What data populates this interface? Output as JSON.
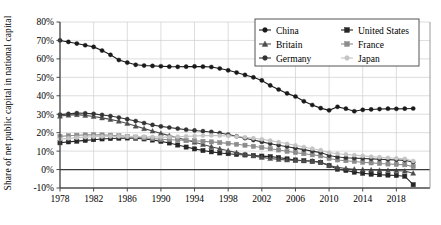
{
  "chart_data": {
    "type": "line",
    "title": "",
    "xlabel": "",
    "ylabel": "Share of net public capital in national capital",
    "xlim": [
      1978,
      2020
    ],
    "ylim": [
      -10,
      80
    ],
    "ytick_labels": [
      "80%",
      "70%",
      "60%",
      "50%",
      "40%",
      "30%",
      "20%",
      "10%",
      "0%",
      "-10%"
    ],
    "ytick_values": [
      80,
      70,
      60,
      50,
      40,
      30,
      20,
      10,
      0,
      -10
    ],
    "xtick_labels": [
      "1978",
      "1982",
      "1986",
      "1990",
      "1994",
      "1998",
      "2002",
      "2006",
      "2010",
      "2014",
      "2018"
    ],
    "xtick_values": [
      1978,
      1982,
      1986,
      1990,
      1994,
      1998,
      2002,
      2006,
      2010,
      2014,
      2018
    ],
    "grid": true,
    "legend_position": "top-right",
    "x": [
      1978,
      1979,
      1980,
      1981,
      1982,
      1983,
      1984,
      1985,
      1986,
      1987,
      1988,
      1989,
      1990,
      1991,
      1992,
      1993,
      1994,
      1995,
      1996,
      1997,
      1998,
      1999,
      2000,
      2001,
      2002,
      2003,
      2004,
      2005,
      2006,
      2007,
      2008,
      2009,
      2010,
      2011,
      2012,
      2013,
      2014,
      2015,
      2016,
      2017,
      2018,
      2019,
      2020
    ],
    "series": [
      {
        "name": "China",
        "color": "#1a1a1a",
        "marker": "circle",
        "values": [
          70,
          69.2,
          68.3,
          67.4,
          66.5,
          64.5,
          62.2,
          59.4,
          58.0,
          56.8,
          56.4,
          56.2,
          56.0,
          55.8,
          55.7,
          55.8,
          55.9,
          55.8,
          55.6,
          54.8,
          53.8,
          52.6,
          51.3,
          50.0,
          48.3,
          45.6,
          43.4,
          41.3,
          39.6,
          37.0,
          35.0,
          33.3,
          32.1,
          34.0,
          33.0,
          31.6,
          32.4,
          32.6,
          32.8,
          33.0,
          32.9,
          33.0,
          33.1
        ]
      },
      {
        "name": "United States",
        "color": "#262626",
        "marker": "square",
        "values": [
          14.5,
          15.0,
          15.4,
          15.8,
          16.2,
          16.6,
          16.8,
          17.0,
          17.1,
          17.0,
          16.6,
          16.0,
          15.3,
          14.4,
          13.3,
          12.2,
          11.2,
          10.3,
          9.6,
          9.0,
          8.6,
          8.2,
          7.9,
          7.6,
          7.3,
          7.0,
          6.5,
          5.8,
          5.2,
          4.8,
          4.5,
          3.9,
          2.2,
          0.2,
          -0.5,
          -1.4,
          -2.0,
          -2.5,
          -2.8,
          -3.0,
          -3.2,
          -3.6,
          -8.2
        ]
      },
      {
        "name": "Britain",
        "color": "#4d4d4d",
        "marker": "triangle",
        "values": [
          29.0,
          29.5,
          29.8,
          29.4,
          28.8,
          28.0,
          27.2,
          26.2,
          25.0,
          23.6,
          22.2,
          20.9,
          19.6,
          18.4,
          17.2,
          16.0,
          14.8,
          13.6,
          12.4,
          11.3,
          10.2,
          9.2,
          8.2,
          7.4,
          6.6,
          6.0,
          5.5,
          5.2,
          5.0,
          4.8,
          4.6,
          4.0,
          2.2,
          1.2,
          0.6,
          0.2,
          0.0,
          -0.2,
          -0.4,
          -0.5,
          -0.6,
          -0.8,
          -2.0
        ]
      },
      {
        "name": "France",
        "color": "#8c8c8c",
        "marker": "square",
        "values": [
          18.0,
          18.3,
          18.6,
          18.8,
          18.9,
          18.8,
          18.6,
          18.3,
          18.0,
          17.6,
          17.2,
          16.8,
          16.4,
          16.2,
          16.0,
          15.8,
          15.6,
          15.3,
          15.0,
          14.6,
          14.2,
          13.7,
          13.2,
          12.6,
          12.0,
          11.3,
          10.6,
          9.9,
          9.2,
          8.6,
          8.0,
          7.4,
          6.0,
          5.2,
          4.8,
          4.4,
          4.0,
          3.6,
          3.3,
          3.0,
          2.8,
          2.6,
          1.6
        ]
      },
      {
        "name": "Germany",
        "color": "#333333",
        "marker": "circle",
        "values": [
          29.8,
          30.2,
          30.6,
          30.5,
          30.2,
          29.6,
          29.0,
          28.2,
          27.3,
          26.3,
          25.2,
          24.2,
          23.4,
          22.8,
          22.2,
          21.6,
          21.2,
          20.8,
          20.4,
          19.8,
          19.0,
          18.0,
          17.0,
          16.0,
          15.0,
          14.0,
          13.2,
          12.4,
          11.6,
          10.8,
          10.0,
          9.2,
          7.6,
          6.8,
          6.4,
          6.2,
          6.0,
          5.8,
          5.6,
          5.4,
          5.2,
          5.0,
          4.0
        ]
      },
      {
        "name": "Japan",
        "color": "#c4c4c4",
        "marker": "circle",
        "values": [
          16.5,
          16.9,
          17.3,
          17.6,
          17.8,
          17.9,
          18.0,
          18.0,
          18.0,
          17.9,
          17.8,
          17.7,
          17.6,
          17.6,
          17.8,
          18.0,
          18.2,
          18.4,
          18.5,
          18.4,
          18.2,
          17.9,
          17.5,
          17.0,
          16.4,
          15.7,
          14.9,
          14.0,
          13.1,
          12.2,
          11.3,
          10.5,
          9.2,
          8.6,
          8.2,
          7.8,
          7.4,
          7.0,
          6.7,
          6.4,
          6.1,
          5.8,
          4.6
        ]
      }
    ]
  },
  "legend": {
    "entries": [
      {
        "label": "China"
      },
      {
        "label": "United States"
      },
      {
        "label": "Britain"
      },
      {
        "label": "France"
      },
      {
        "label": "Germany"
      },
      {
        "label": "Japan"
      }
    ]
  }
}
